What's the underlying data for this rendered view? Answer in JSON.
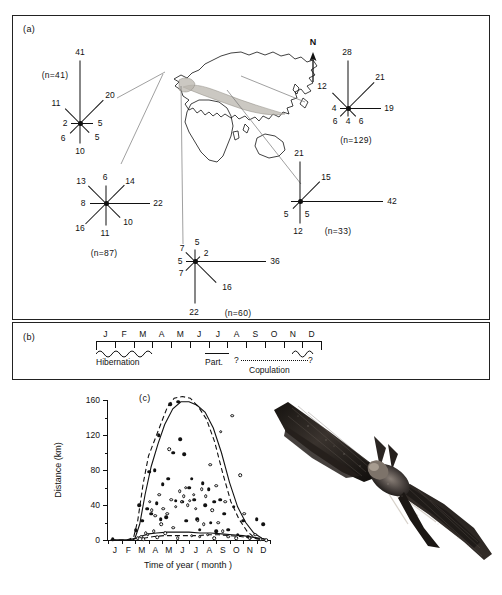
{
  "figure": {
    "panels": [
      {
        "id": "a",
        "tag": "(a)"
      },
      {
        "id": "b",
        "tag": "(b)"
      },
      {
        "id": "c",
        "tag": "(c)"
      }
    ]
  },
  "panel_a": {
    "tag": "(a)",
    "north_label": "N",
    "map_name": "eurasia-africa-range-map",
    "roses": [
      {
        "name": "rose-n41",
        "sample_label": "(n=41)",
        "n": 41,
        "directions": [
          "N",
          "NE",
          "E",
          "SE",
          "S",
          "SW",
          "W",
          "NW"
        ],
        "values": [
          41,
          20,
          5,
          5,
          10,
          6,
          2,
          11
        ]
      },
      {
        "name": "rose-n87",
        "sample_label": "(n=87)",
        "n": 87,
        "directions": [
          "N",
          "NE",
          "E",
          "SE",
          "S",
          "SW",
          "W",
          "NW"
        ],
        "values": [
          6,
          14,
          22,
          10,
          11,
          16,
          8,
          13
        ]
      },
      {
        "name": "rose-n129",
        "sample_label": "(n=129)",
        "n": 129,
        "directions": [
          "N",
          "NE",
          "E",
          "SE",
          "S",
          "SW",
          "W",
          "NW"
        ],
        "values": [
          28,
          21,
          19,
          6,
          4,
          6,
          4,
          12
        ]
      },
      {
        "name": "rose-n33",
        "sample_label": "(n=33)",
        "n": 33,
        "directions": [
          "N",
          "NE",
          "E",
          "SE",
          "S",
          "SW",
          "W",
          "NW"
        ],
        "values": [
          21,
          15,
          42,
          0,
          12,
          5,
          5,
          0
        ]
      },
      {
        "name": "rose-n60",
        "sample_label": "(n=60)",
        "n": 60,
        "directions": [
          "N",
          "NE",
          "E",
          "SE",
          "S",
          "SW",
          "W",
          "NW"
        ],
        "values": [
          5,
          2,
          36,
          16,
          22,
          7,
          5,
          7
        ]
      }
    ]
  },
  "panel_b": {
    "tag": "(b)",
    "months": [
      "J",
      "F",
      "M",
      "A",
      "M",
      "J",
      "J",
      "A",
      "S",
      "O",
      "N",
      "D"
    ],
    "annotations": [
      {
        "name": "hibernation-annotation",
        "label": "Hibernation"
      },
      {
        "name": "parturition-annotation",
        "label": "Part."
      },
      {
        "name": "copulation-annotation",
        "label": "Copulation"
      },
      {
        "name": "copulation-start-query",
        "label": "?"
      },
      {
        "name": "copulation-end-query",
        "label": "?"
      }
    ]
  },
  "chart_data": {
    "type": "scatter",
    "tag": "(c)",
    "title": "",
    "xlabel": "Time of year ( month )",
    "ylabel": "Distance (km)",
    "xlim": [
      0,
      12
    ],
    "ylim": [
      0,
      160
    ],
    "yticks": [
      0,
      40,
      80,
      120,
      160
    ],
    "yticks_minor": [
      20,
      60,
      100,
      140
    ],
    "xticklabels": [
      "J",
      "F",
      "M",
      "A",
      "M",
      "J",
      "J",
      "A",
      "S",
      "O",
      "N",
      "D"
    ],
    "grid": false,
    "legend": [],
    "series": [
      {
        "name": "filled-circles",
        "marker": "filled circle",
        "points": [
          [
            0.35,
            1
          ],
          [
            2.05,
            11
          ],
          [
            2.3,
            40
          ],
          [
            2.55,
            22
          ],
          [
            2.9,
            36
          ],
          [
            3.05,
            78
          ],
          [
            3.2,
            30
          ],
          [
            3.45,
            80
          ],
          [
            3.6,
            42
          ],
          [
            3.75,
            120
          ],
          [
            3.9,
            24
          ],
          [
            4.05,
            64
          ],
          [
            4.3,
            26
          ],
          [
            4.45,
            70
          ],
          [
            4.6,
            155
          ],
          [
            4.85,
            100
          ],
          [
            5.0,
            45
          ],
          [
            5.2,
            158
          ],
          [
            5.35,
            115
          ],
          [
            5.5,
            44
          ],
          [
            5.65,
            98
          ],
          [
            5.8,
            22
          ],
          [
            6.0,
            60
          ],
          [
            6.2,
            70
          ],
          [
            6.4,
            46
          ],
          [
            6.6,
            24
          ],
          [
            6.8,
            12
          ],
          [
            7.0,
            65
          ],
          [
            7.2,
            40
          ],
          [
            7.45,
            58
          ],
          [
            7.6,
            20
          ],
          [
            7.85,
            44
          ],
          [
            8.0,
            10
          ],
          [
            8.3,
            46
          ],
          [
            8.6,
            30
          ],
          [
            8.9,
            12
          ],
          [
            9.3,
            38
          ],
          [
            9.6,
            6
          ],
          [
            10.0,
            22
          ],
          [
            10.4,
            4
          ],
          [
            11.0,
            24
          ],
          [
            11.5,
            18
          ]
        ]
      },
      {
        "name": "open-circles",
        "marker": "open circle",
        "points": [
          [
            2.2,
            2
          ],
          [
            2.45,
            4
          ],
          [
            2.6,
            1
          ],
          [
            2.8,
            8
          ],
          [
            2.95,
            6
          ],
          [
            3.1,
            44
          ],
          [
            3.25,
            34
          ],
          [
            3.4,
            10
          ],
          [
            3.5,
            28
          ],
          [
            3.65,
            3
          ],
          [
            3.8,
            52
          ],
          [
            3.95,
            18
          ],
          [
            4.1,
            36
          ],
          [
            4.25,
            8
          ],
          [
            4.4,
            30
          ],
          [
            4.55,
            104
          ],
          [
            4.7,
            46
          ],
          [
            4.85,
            14
          ],
          [
            5.0,
            38
          ],
          [
            5.15,
            2
          ],
          [
            5.3,
            56
          ],
          [
            5.45,
            44
          ],
          [
            5.6,
            50
          ],
          [
            5.75,
            60
          ],
          [
            5.9,
            40
          ],
          [
            6.05,
            45
          ],
          [
            6.2,
            5
          ],
          [
            6.35,
            52
          ],
          [
            6.5,
            36
          ],
          [
            6.65,
            22
          ],
          [
            6.8,
            4
          ],
          [
            6.95,
            58
          ],
          [
            7.1,
            18
          ],
          [
            7.25,
            50
          ],
          [
            7.4,
            6
          ],
          [
            7.55,
            86
          ],
          [
            7.7,
            34
          ],
          [
            7.85,
            2
          ],
          [
            8.0,
            62
          ],
          [
            8.15,
            20
          ],
          [
            8.35,
            124
          ],
          [
            8.5,
            10
          ],
          [
            8.7,
            44
          ],
          [
            8.9,
            4
          ],
          [
            9.2,
            142
          ],
          [
            9.5,
            2
          ],
          [
            9.8,
            74
          ],
          [
            10.1,
            30
          ],
          [
            10.5,
            2
          ],
          [
            10.9,
            6
          ],
          [
            11.3,
            1
          ],
          [
            11.7,
            0
          ]
        ]
      }
    ],
    "curves": [
      {
        "name": "upper-envelope-dashed",
        "style": "dashed",
        "points": [
          [
            0.2,
            0
          ],
          [
            1.4,
            0
          ],
          [
            1.9,
            3
          ],
          [
            2.2,
            22
          ],
          [
            2.6,
            64
          ],
          [
            3.0,
            96
          ],
          [
            3.4,
            112
          ],
          [
            3.9,
            132
          ],
          [
            4.4,
            152
          ],
          [
            4.9,
            162
          ],
          [
            5.5,
            164
          ],
          [
            6.1,
            162
          ],
          [
            6.7,
            152
          ],
          [
            7.3,
            138
          ],
          [
            7.9,
            112
          ],
          [
            8.5,
            76
          ],
          [
            9.1,
            44
          ],
          [
            9.7,
            24
          ],
          [
            10.3,
            10
          ],
          [
            10.9,
            2
          ],
          [
            11.5,
            0
          ]
        ]
      },
      {
        "name": "upper-envelope-solid",
        "style": "solid",
        "points": [
          [
            0.2,
            0
          ],
          [
            1.5,
            0
          ],
          [
            2.0,
            2
          ],
          [
            2.35,
            18
          ],
          [
            2.75,
            52
          ],
          [
            3.2,
            84
          ],
          [
            3.7,
            110
          ],
          [
            4.2,
            132
          ],
          [
            4.8,
            150
          ],
          [
            5.4,
            158
          ],
          [
            6.0,
            158
          ],
          [
            6.6,
            154
          ],
          [
            7.2,
            146
          ],
          [
            7.8,
            128
          ],
          [
            8.4,
            100
          ],
          [
            9.0,
            66
          ],
          [
            9.6,
            38
          ],
          [
            10.2,
            20
          ],
          [
            10.8,
            8
          ],
          [
            11.4,
            2
          ],
          [
            11.8,
            0
          ]
        ]
      },
      {
        "name": "baseline-mean-solid",
        "style": "solid",
        "points": [
          [
            0.2,
            0
          ],
          [
            1.8,
            0
          ],
          [
            2.4,
            4
          ],
          [
            3.0,
            7
          ],
          [
            3.6,
            8
          ],
          [
            4.4,
            9
          ],
          [
            5.2,
            9
          ],
          [
            6.0,
            9
          ],
          [
            6.8,
            8
          ],
          [
            7.6,
            8
          ],
          [
            8.4,
            7
          ],
          [
            9.2,
            6
          ],
          [
            10.0,
            5
          ],
          [
            10.8,
            3
          ],
          [
            11.6,
            1
          ]
        ]
      },
      {
        "name": "baseline-mean-dashed",
        "style": "dashed",
        "points": [
          [
            2.6,
            2
          ],
          [
            3.4,
            4
          ],
          [
            4.2,
            5
          ],
          [
            5.0,
            5
          ],
          [
            5.8,
            5
          ],
          [
            6.6,
            5
          ],
          [
            7.4,
            6
          ],
          [
            8.2,
            6
          ],
          [
            9.0,
            5
          ],
          [
            9.8,
            4
          ],
          [
            10.6,
            2
          ],
          [
            11.4,
            1
          ]
        ]
      }
    ]
  },
  "illustration": {
    "name": "bat-in-flight-photograph"
  },
  "colors": {
    "ink": "#111111",
    "paper": "#ffffff",
    "range_shade": "#b9b5ae",
    "leader": "#777777"
  }
}
